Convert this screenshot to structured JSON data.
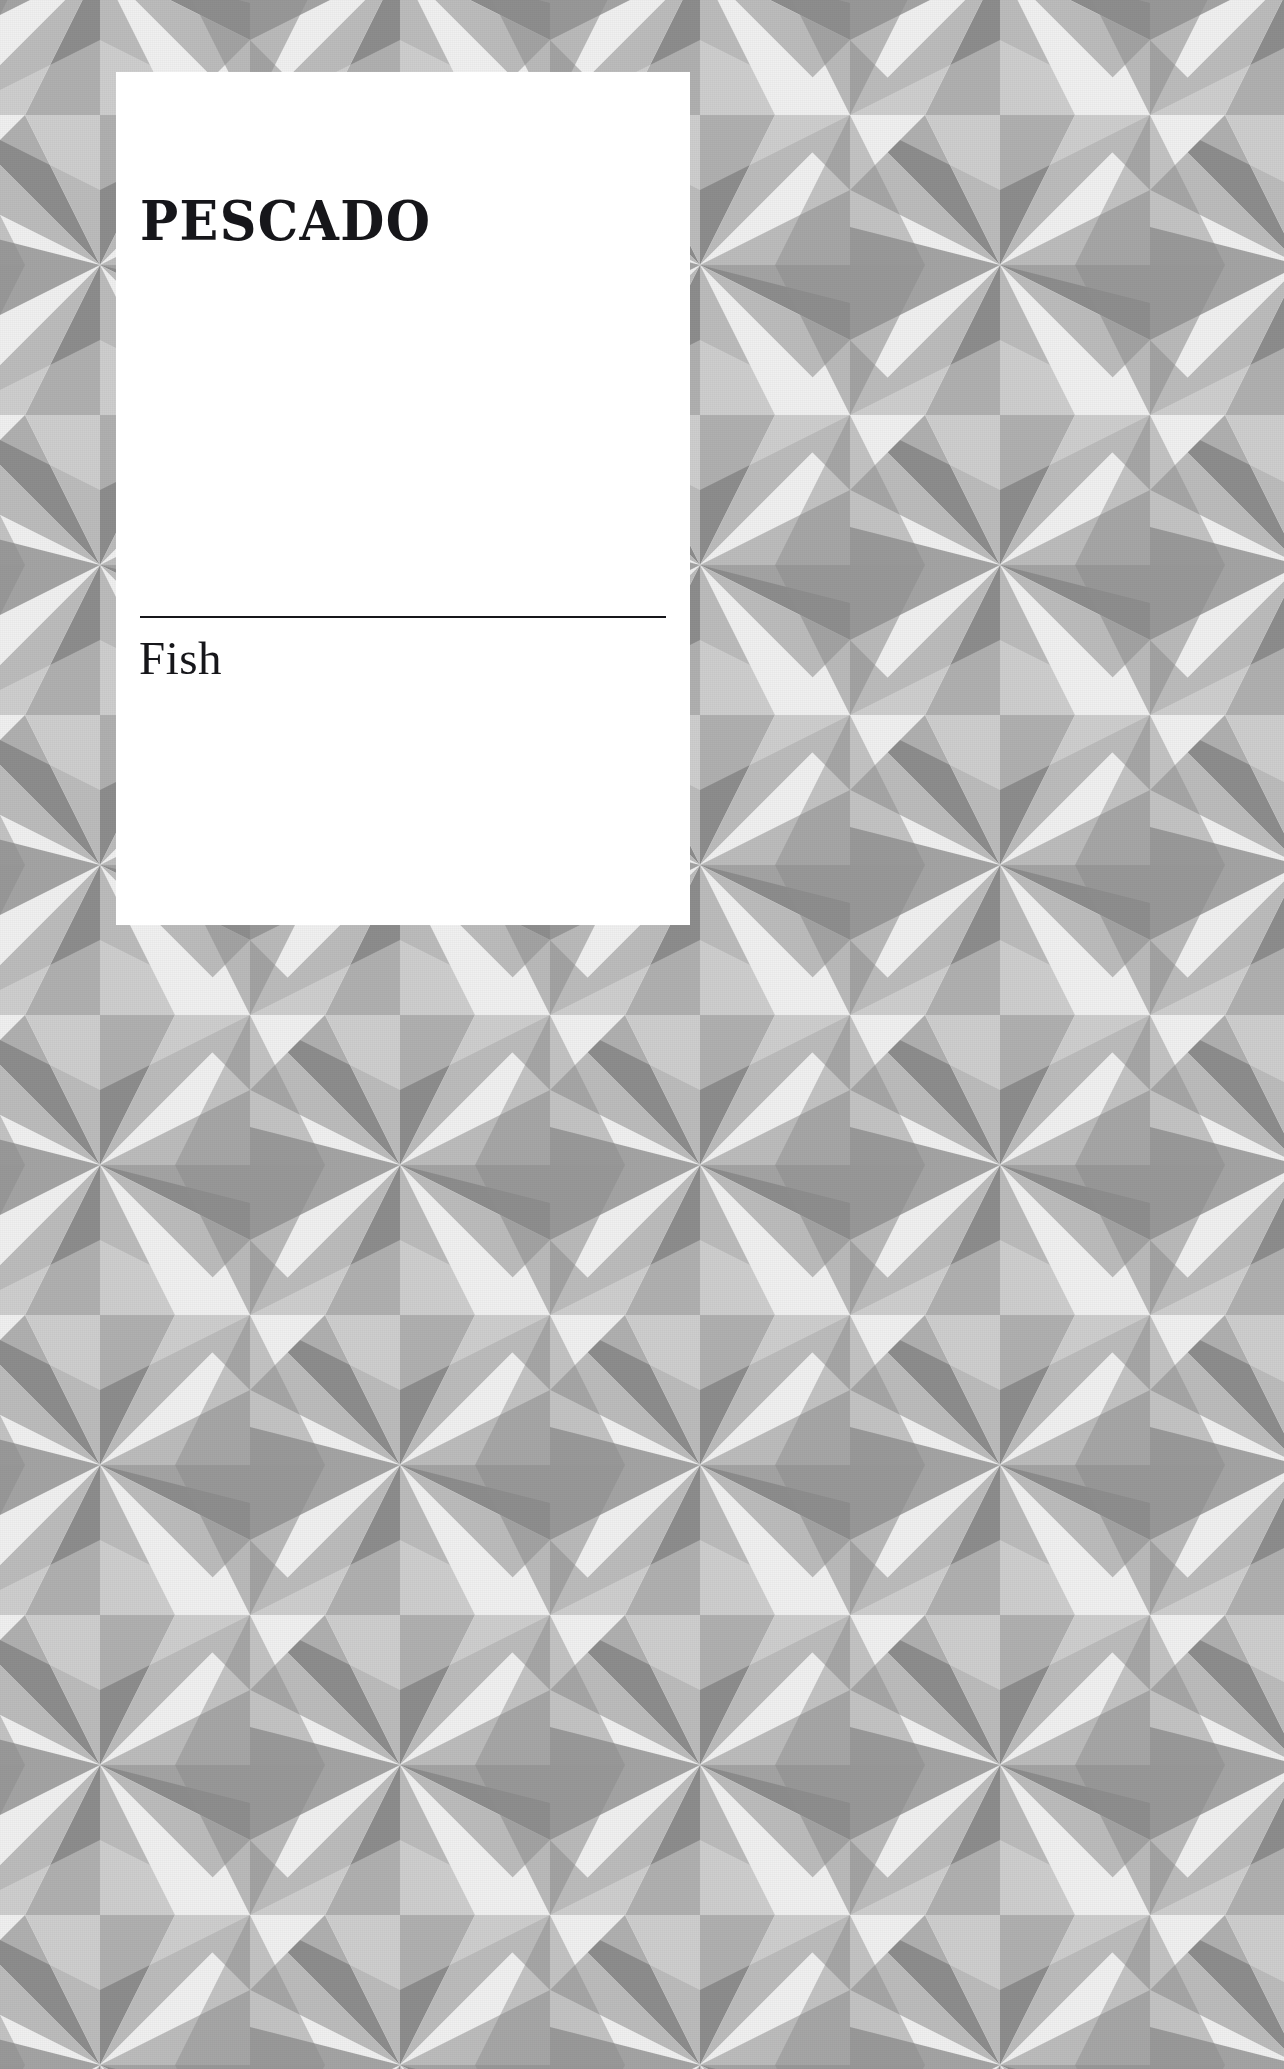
{
  "page": {
    "width": 1284,
    "height": 2069,
    "kind": "book-chapter-divider-page"
  },
  "card": {
    "title": "PESCADO",
    "subtitle": "Fish",
    "divider": "horizontal-rule",
    "background_color": "#ffffff",
    "text_color": "#16161a"
  },
  "background": {
    "name": "geometric-triangle-tessellation",
    "colors": {
      "light": "#f0f0f0",
      "mid": "#bcbcbc",
      "dark": "#8d8d8d",
      "mid_dark": "#a4a4a4"
    },
    "tile": {
      "width": 300,
      "height": 300,
      "origin_x": -50,
      "origin_y": 115
    }
  }
}
